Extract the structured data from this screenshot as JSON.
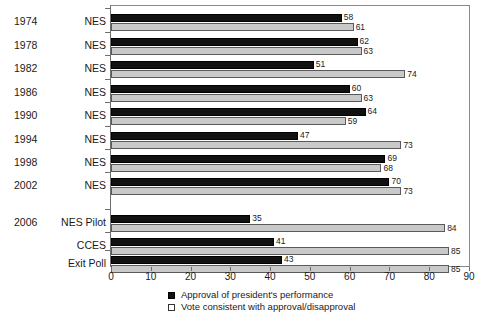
{
  "chart_data": {
    "type": "bar",
    "orientation": "horizontal",
    "title": "",
    "xlabel": "",
    "ylabel": "",
    "xlim": [
      0,
      90
    ],
    "xticks": [
      0,
      10,
      20,
      30,
      40,
      50,
      60,
      70,
      80,
      90
    ],
    "grid": false,
    "legend_position": "bottom",
    "series": [
      {
        "name": "Approval of president's performance",
        "color": "#111111",
        "values": [
          58,
          62,
          51,
          60,
          64,
          47,
          69,
          70,
          35,
          41,
          43
        ]
      },
      {
        "name": "Vote consistent with approval/disapproval",
        "color": "#c9c9c9",
        "values": [
          61,
          63,
          74,
          63,
          59,
          73,
          68,
          73,
          84,
          85,
          85
        ]
      }
    ],
    "categories": [
      "1974 NES",
      "1978 NES",
      "1982 NES",
      "1986 NES",
      "1990 NES",
      "1994 NES",
      "1998 NES",
      "2002 NES",
      "2006 NES Pilot",
      "2006 CCES",
      "2006 Exit Poll"
    ],
    "rows": [
      {
        "year": "1974",
        "survey": "NES",
        "approval": 58,
        "consistent": 61,
        "group": "top"
      },
      {
        "year": "1978",
        "survey": "NES",
        "approval": 62,
        "consistent": 63,
        "group": "top"
      },
      {
        "year": "1982",
        "survey": "NES",
        "approval": 51,
        "consistent": 74,
        "group": "top"
      },
      {
        "year": "1986",
        "survey": "NES",
        "approval": 60,
        "consistent": 63,
        "group": "top"
      },
      {
        "year": "1990",
        "survey": "NES",
        "approval": 64,
        "consistent": 59,
        "group": "top"
      },
      {
        "year": "1994",
        "survey": "NES",
        "approval": 47,
        "consistent": 73,
        "group": "top"
      },
      {
        "year": "1998",
        "survey": "NES",
        "approval": 69,
        "consistent": 68,
        "group": "top"
      },
      {
        "year": "2002",
        "survey": "NES",
        "approval": 70,
        "consistent": 73,
        "group": "top"
      },
      {
        "year": "2006",
        "survey": "NES Pilot",
        "approval": 35,
        "consistent": 84,
        "group": "bottom"
      },
      {
        "year": "",
        "survey": "CCES",
        "approval": 41,
        "consistent": 85,
        "group": "bottom"
      },
      {
        "year": "",
        "survey": "Exit Poll",
        "approval": 43,
        "consistent": 85,
        "group": "bottom"
      }
    ]
  },
  "legend": {
    "items": [
      {
        "label": "Approval of president's performance",
        "swatch": "black"
      },
      {
        "label": "Vote consistent with approval/disapproval",
        "swatch": "gray"
      }
    ]
  }
}
